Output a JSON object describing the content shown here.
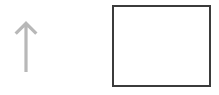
{
  "canvas": {
    "width": 219,
    "height": 95,
    "background_color": "#ffffff",
    "title": "Arrow and empty box diagram"
  },
  "shapes": [
    {
      "name": "up-arrow",
      "kind": "arrow",
      "direction": "up",
      "color": "#b8b8b8",
      "x": 12,
      "y": 17,
      "width": 28,
      "height": 60,
      "shaft_width": 3,
      "head_width": 17,
      "head_height": 11,
      "label": ""
    },
    {
      "name": "empty-box",
      "kind": "rectangle",
      "stroke_color": "#3b3b3b",
      "fill_color": "#ffffff",
      "stroke_width": 2,
      "x": 112,
      "y": 5,
      "width": 99,
      "height": 82,
      "label": ""
    }
  ],
  "arrow": {
    "color": "#b8b8b8",
    "direction": "up"
  },
  "box": {
    "stroke_color": "#3b3b3b",
    "fill_color": "#ffffff",
    "content": ""
  }
}
